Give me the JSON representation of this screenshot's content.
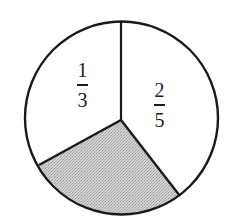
{
  "diagram": {
    "type": "pie-fraction-diagram",
    "sectors": [
      {
        "id": "one-third",
        "numerator": "1",
        "denominator": "3",
        "shaded": false
      },
      {
        "id": "two-fifths",
        "numerator": "2",
        "denominator": "5",
        "shaded": false
      },
      {
        "id": "remainder",
        "label": "",
        "shaded": true
      }
    ],
    "colors": {
      "stroke": "#1a1a1a",
      "shade": "#c8c8c8",
      "background": "#ffffff"
    }
  }
}
